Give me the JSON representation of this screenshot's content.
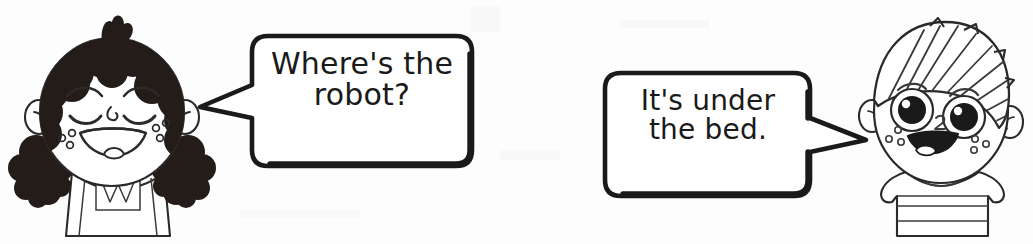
{
  "scene": {
    "title": "Where's the robot? It's under the bed.",
    "type": "line-art-illustration",
    "width": 1033,
    "height": 244,
    "background_color": "#fdfdfd",
    "ink_color": "#1a1a1a"
  },
  "conversation": [
    {
      "speaker": "girl",
      "speaker_label": "girl-character",
      "bubble_label": "speech-bubble-left",
      "text": "Where's the\nrobot?",
      "line1": "Where's the",
      "line2": "robot?",
      "tail_direction": "left"
    },
    {
      "speaker": "boy",
      "speaker_label": "boy-character",
      "bubble_label": "speech-bubble-right",
      "text": "It's under\nthe bed.",
      "line1": "It's under",
      "line2": "the bed.",
      "tail_direction": "right"
    }
  ],
  "characters": {
    "girl": {
      "name": "girl-character",
      "hair": "curly dark hair with topknot and two pigtails",
      "hair_color": "#241c18",
      "eyes": "closed happy curved eyes",
      "mouth": "open smile with tongue",
      "freckles": "two clusters of three small circles",
      "clothing": "sleeveless dress with bib panel and zigzag W detail",
      "position": "left"
    },
    "boy": {
      "name": "boy-character",
      "hair": "short hatched hair swept to the right",
      "hair_color": "#ffffff",
      "eyes": "large round eyes with dark pupils and highlights",
      "mouth": "open smile",
      "freckles": "two clusters of small circles",
      "clothing": "striped t-shirt with round collar",
      "position": "right"
    }
  },
  "colors": {
    "ink": "#1a1a1a",
    "hair_dark": "#241c18",
    "paper": "#fdfdfd",
    "outline": "#2a2a2a"
  }
}
